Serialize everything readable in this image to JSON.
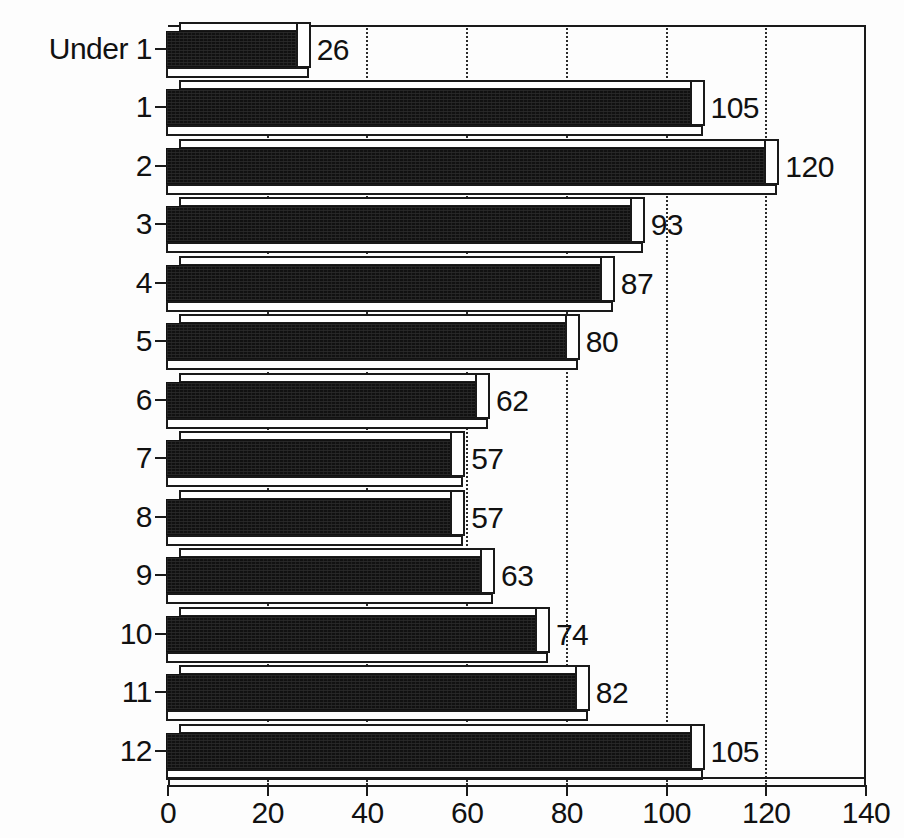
{
  "chart_data": {
    "type": "bar",
    "orientation": "horizontal",
    "title": "",
    "subtitle": "",
    "xlabel": "",
    "ylabel": "",
    "categories": [
      "Under 1",
      "1",
      "2",
      "3",
      "4",
      "5",
      "6",
      "7",
      "8",
      "9",
      "10",
      "11",
      "12"
    ],
    "values": [
      26,
      105,
      120,
      93,
      87,
      80,
      62,
      57,
      57,
      63,
      74,
      82,
      105
    ],
    "data_labels": [
      "26",
      "105",
      "120",
      "93",
      "87",
      "80",
      "62",
      "57",
      "57",
      "63",
      "74",
      "82",
      "105"
    ],
    "xlim": [
      0,
      140
    ],
    "xticks": [
      0,
      20,
      40,
      60,
      80,
      100,
      120,
      140
    ],
    "xtick_labels": [
      "0",
      "20",
      "40",
      "60",
      "80",
      "100",
      "120",
      "140"
    ],
    "gridlines": {
      "vertical": [
        20,
        40,
        60,
        80,
        100,
        120
      ],
      "horizontal": [],
      "style": "dotted"
    },
    "legend": {
      "visible": false,
      "entries": []
    },
    "series": [
      {
        "name": "",
        "values": [
          26,
          105,
          120,
          93,
          87,
          80,
          62,
          57,
          57,
          63,
          74,
          82,
          105
        ]
      }
    ],
    "style": {
      "bar_fill": "#111111",
      "bar_edge": "#1a1a1a",
      "bar_3d": true,
      "background": "#fdfdfd",
      "frame": "top-right"
    }
  }
}
